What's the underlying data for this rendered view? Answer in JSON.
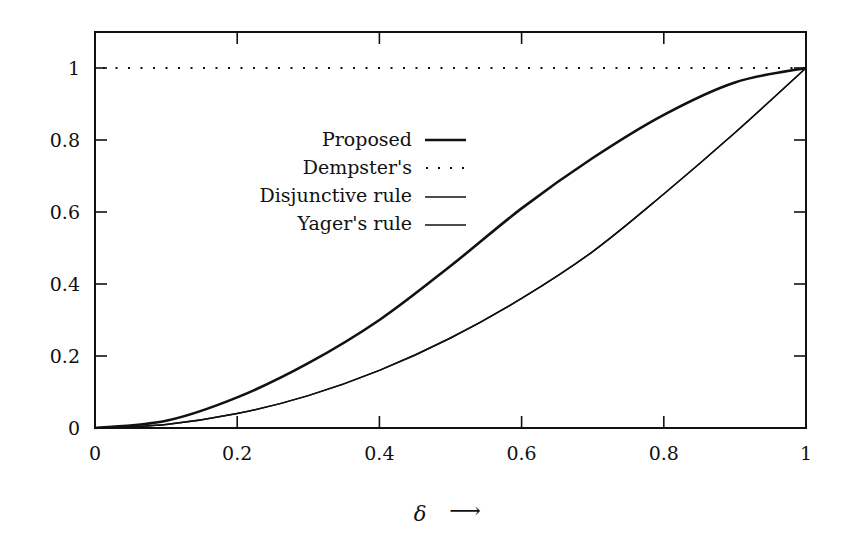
{
  "chart_data": {
    "type": "line",
    "title": "",
    "xlabel": "δ ⟶",
    "ylabel": "",
    "xlim": [
      0,
      1
    ],
    "ylim": [
      0,
      1.1
    ],
    "grid": false,
    "legend_position": "upper-left-center",
    "x_ticks": [
      "0",
      "0.2",
      "0.4",
      "0.6",
      "0.8",
      "1"
    ],
    "y_ticks": [
      "0",
      "0.2",
      "0.4",
      "0.6",
      "0.8",
      "1"
    ],
    "x": [
      0,
      0.1,
      0.2,
      0.3,
      0.4,
      0.5,
      0.6,
      0.7,
      0.8,
      0.9,
      1.0
    ],
    "series": [
      {
        "name": "Proposed",
        "style": "solid-thick",
        "values": [
          0,
          0.02,
          0.085,
          0.18,
          0.3,
          0.45,
          0.61,
          0.75,
          0.87,
          0.96,
          1.0
        ]
      },
      {
        "name": "Dempster's",
        "style": "dotted",
        "values": [
          1,
          1,
          1,
          1,
          1,
          1,
          1,
          1,
          1,
          1,
          1
        ]
      },
      {
        "name": "Disjunctive rule",
        "style": "solid-thin",
        "values": [
          0,
          0.01,
          0.04,
          0.09,
          0.16,
          0.25,
          0.36,
          0.49,
          0.65,
          0.82,
          1.0
        ]
      },
      {
        "name": "Yager's rule",
        "style": "solid-thin",
        "values": [
          0,
          0.01,
          0.04,
          0.09,
          0.16,
          0.25,
          0.36,
          0.49,
          0.65,
          0.82,
          1.0
        ]
      }
    ]
  },
  "axis": {
    "x_label_symbol": "δ",
    "x_label_arrow": "⟶"
  },
  "legend": {
    "items": [
      {
        "label": "Proposed"
      },
      {
        "label": "Dempster's"
      },
      {
        "label": "Disjunctive rule"
      },
      {
        "label": "Yager's rule"
      }
    ]
  },
  "colors": {
    "ink": "#111111",
    "background": "#ffffff"
  }
}
